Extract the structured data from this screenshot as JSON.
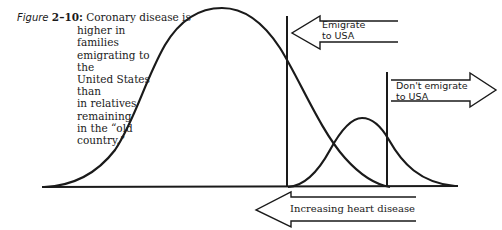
{
  "figure": {
    "label": "Figure",
    "number": "2–10:",
    "caption_lines": [
      "Coronary disease is",
      "higher in families",
      "emigrating to the",
      "United States than",
      "in relatives",
      "remaining",
      "in the “old",
      "country.”"
    ]
  },
  "arrows": {
    "emigrate": {
      "line1": "Emigrate",
      "line2": "to USA",
      "direction": "left"
    },
    "dont_emigrate": {
      "line1": "Don't emigrate",
      "line2": "to USA",
      "direction": "right"
    },
    "axis": {
      "label": "Increasing heart disease",
      "direction": "left"
    }
  },
  "curves": {
    "large": "population remaining in old country (larger distribution)",
    "small": "population emigrating to USA (smaller distribution)"
  },
  "colors": {
    "ink": "#1a1a1a",
    "background": "#ffffff"
  }
}
